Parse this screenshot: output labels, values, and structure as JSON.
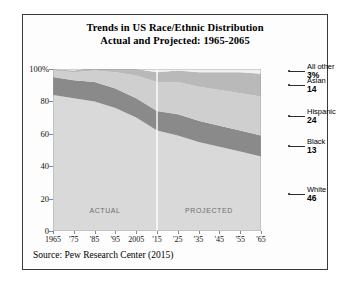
{
  "figure": {
    "title_line1": "Trends in US Race/Ethnic Distribution",
    "title_line2": "Actual and Projected: 1965-2065",
    "source": "Source: Pew Research Center (2015)"
  },
  "legend": [
    {
      "name": "All other",
      "value": "3%",
      "at": 98.5,
      "color": "#efefef"
    },
    {
      "name": "Asian",
      "value": "14",
      "at": 90.0,
      "color": "#b9b9b9"
    },
    {
      "name": "Hispanic",
      "value": "24",
      "at": 71.0,
      "color": "#cfcfcf"
    },
    {
      "name": "Black",
      "value": "13",
      "at": 52.5,
      "color": "#8a8a8a"
    },
    {
      "name": "White",
      "value": "46",
      "at": 23.0,
      "color": "#d9d9d9"
    }
  ],
  "chart_data": {
    "type": "area",
    "title": "Trends in US Race/Ethnic Distribution Actual and Projected: 1965-2065",
    "xlabel": "",
    "ylabel": "",
    "ylim": [
      0,
      100
    ],
    "xlim": [
      1965,
      2065
    ],
    "grid": false,
    "stacked": true,
    "legend_position": "right",
    "x": [
      1965,
      1975,
      1985,
      1995,
      2005,
      2015,
      2025,
      2035,
      2045,
      2055,
      2065
    ],
    "tick_labels": [
      "1965",
      "'75",
      "'85",
      "'95",
      "2005",
      "'15",
      "'25",
      "'35",
      "'45",
      "'55",
      "'65"
    ],
    "ytick_labels": [
      "0",
      "20",
      "40",
      "60",
      "80",
      "100%"
    ],
    "yticks": [
      0,
      20,
      40,
      60,
      80,
      100
    ],
    "series": [
      {
        "name": "White",
        "color": "#d9d9d9",
        "values": [
          84,
          82,
          80,
          76,
          70,
          62,
          59,
          55,
          52,
          49,
          46
        ]
      },
      {
        "name": "Black",
        "color": "#8a8a8a",
        "values": [
          11,
          11,
          12,
          12,
          12,
          12,
          13,
          13,
          13,
          13,
          13
        ]
      },
      {
        "name": "Hispanic",
        "color": "#cfcfcf",
        "values": [
          4,
          5,
          7,
          10,
          14,
          18,
          20,
          21,
          22,
          23,
          24
        ]
      },
      {
        "name": "Asian",
        "color": "#b9b9b9",
        "values": [
          1,
          1,
          2,
          3,
          4,
          6,
          7,
          9,
          11,
          13,
          14
        ]
      },
      {
        "name": "All other",
        "color": "#efefef",
        "values": [
          0,
          1,
          1,
          2,
          2,
          2,
          2,
          2,
          2,
          3,
          3
        ]
      }
    ],
    "annotations": [
      {
        "text": "ACTUAL",
        "x": 1990,
        "y": 13
      },
      {
        "text": "PROJECTED",
        "x": 2040,
        "y": 13
      }
    ],
    "divider": {
      "x": 2015,
      "color": "#ffffff"
    }
  }
}
